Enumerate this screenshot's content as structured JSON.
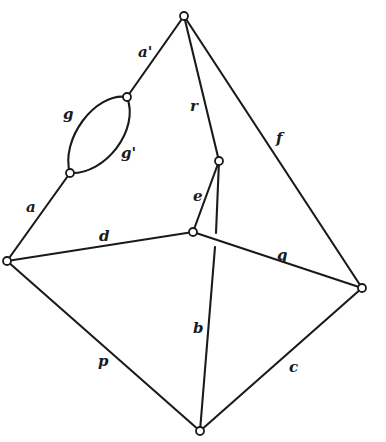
{
  "diagram": {
    "type": "graph",
    "colors": {
      "stroke": "#1a1a1a",
      "background": "#ffffff",
      "vertex_fill": "#ffffff"
    },
    "vertices": [
      {
        "id": "top",
        "x": 184,
        "y": 16
      },
      {
        "id": "loop_upper",
        "x": 127,
        "y": 97
      },
      {
        "id": "loop_lower",
        "x": 70,
        "y": 173
      },
      {
        "id": "left",
        "x": 7,
        "y": 261
      },
      {
        "id": "inner",
        "x": 219,
        "y": 161
      },
      {
        "id": "center",
        "x": 193,
        "y": 232
      },
      {
        "id": "right",
        "x": 362,
        "y": 288
      },
      {
        "id": "bottom",
        "x": 200,
        "y": 431
      }
    ],
    "edges": [
      {
        "id": "a_prime",
        "label": "a'",
        "from": "top",
        "to": "loop_upper",
        "path": "M184,16 L127,97",
        "label_x": 138,
        "label_y": 57
      },
      {
        "id": "g",
        "label": "g",
        "from": "loop_upper",
        "to": "loop_lower",
        "path": "M127,97 C95,92 60,140 70,173",
        "label_x": 63,
        "label_y": 119
      },
      {
        "id": "g_prime",
        "label": "g'",
        "from": "loop_upper",
        "to": "loop_lower",
        "path": "M127,97 C140,130 105,175 70,173",
        "label_x": 121,
        "label_y": 158
      },
      {
        "id": "a",
        "label": "a",
        "from": "loop_lower",
        "to": "left",
        "path": "M70,173 L7,261",
        "label_x": 26,
        "label_y": 212
      },
      {
        "id": "r",
        "label": "r",
        "from": "top",
        "to": "inner",
        "path": "M184,16 L219,161",
        "label_x": 190,
        "label_y": 111
      },
      {
        "id": "f",
        "label": "f",
        "from": "top",
        "to": "right",
        "path": "M184,16 L362,288",
        "label_x": 276,
        "label_y": 143
      },
      {
        "id": "e",
        "label": "e",
        "from": "inner",
        "to": "center",
        "path": "M219,161 L193,232",
        "label_x": 193,
        "label_y": 201
      },
      {
        "id": "d",
        "label": "d",
        "from": "left",
        "to": "center",
        "path": "M7,261 L193,232",
        "label_x": 99,
        "label_y": 241
      },
      {
        "id": "q",
        "label": "q",
        "from": "center",
        "to": "right",
        "path": "M193,232 L362,288",
        "label_x": 277,
        "label_y": 260
      },
      {
        "id": "b_upper",
        "label": "",
        "from": "inner",
        "to": "crossing",
        "path": "M219,161 L216,233"
      },
      {
        "id": "b",
        "label": "b",
        "from": "crossing",
        "to": "bottom",
        "path": "M215,247 L200,431",
        "label_x": 193,
        "label_y": 333
      },
      {
        "id": "p",
        "label": "p",
        "from": "left",
        "to": "bottom",
        "path": "M7,261 L200,431",
        "label_x": 98,
        "label_y": 366
      },
      {
        "id": "c",
        "label": "c",
        "from": "bottom",
        "to": "right",
        "path": "M200,431 L362,288",
        "label_x": 289,
        "label_y": 372
      }
    ]
  }
}
